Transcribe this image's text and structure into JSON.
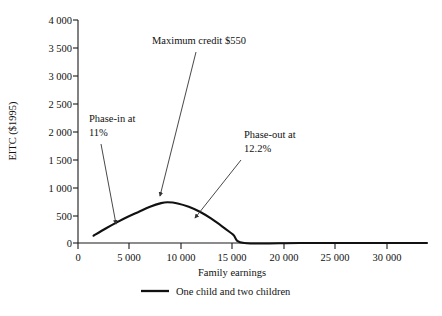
{
  "chart_data": {
    "type": "line",
    "title": "",
    "xlabel": "Family earnings",
    "ylabel": "EITC ($1995)",
    "xlim": [
      0,
      31500
    ],
    "ylim": [
      0,
      4000
    ],
    "grid": false,
    "legend_position": "bottom-center",
    "x_ticks": [
      0,
      5000,
      10000,
      15000,
      20000,
      25000,
      30000
    ],
    "x_tick_labels": [
      "0",
      "5 000",
      "10 000",
      "15 000",
      "20 000",
      "25 000",
      "30 000"
    ],
    "y_ticks": [
      0,
      500,
      1000,
      1500,
      2000,
      2500,
      3000,
      3500,
      4000
    ],
    "y_tick_labels": [
      "0",
      "500",
      "1 000",
      "1 500",
      "2 000",
      "2 500",
      "3 000",
      "3 500",
      "4 000"
    ],
    "series": [
      {
        "name": "One child and two children",
        "color": "#111111",
        "x": [
          1400,
          2500,
          3500,
          4500,
          5500,
          6500,
          7500,
          8100,
          9000,
          10000,
          11000,
          12000,
          13000,
          14000,
          15000,
          20000,
          25000,
          30000,
          31500
        ],
        "y": [
          130,
          260,
          370,
          470,
          560,
          650,
          715,
          730,
          710,
          650,
          560,
          440,
          300,
          150,
          0,
          0,
          0,
          0,
          0
        ]
      }
    ],
    "annotations": [
      {
        "name": "phase-in",
        "lines": [
          "Phase-in at",
          "11%"
        ],
        "text": "Phase-in at 11%",
        "value": "11%",
        "target_x": 3600,
        "target_y": 370
      },
      {
        "name": "maximum-credit",
        "lines": [
          "Maximum credit $550"
        ],
        "text": "Maximum credit $550",
        "value": "$550",
        "target_x": 7800,
        "target_y": 730
      },
      {
        "name": "phase-out",
        "lines": [
          "Phase-out at",
          "12.2%"
        ],
        "text": "Phase-out at 12.2%",
        "value": "12.2%",
        "target_x": 11400,
        "target_y": 520
      }
    ]
  },
  "axes": {
    "y_title": "EITC ($1995)",
    "x_title": "Family earnings",
    "y_labels": [
      "4 000",
      "3 500",
      "3 000",
      "2 500",
      "2 000",
      "1 500",
      "1 000",
      "500",
      "0"
    ],
    "x_labels": [
      "0",
      "5 000",
      "10 000",
      "15 000",
      "20 000",
      "25 000",
      "30 000"
    ]
  },
  "annotations": {
    "phase_in_line1": "Phase-in at",
    "phase_in_line2": "11%",
    "max_credit": "Maximum credit $550",
    "phase_out_line1": "Phase-out at",
    "phase_out_line2": "12.2%"
  },
  "legend": {
    "entry_label": "One child and two children"
  },
  "colors": {
    "series": "#111111",
    "axis": "#1a1a1a",
    "background": "#ffffff",
    "text": "#111111"
  }
}
